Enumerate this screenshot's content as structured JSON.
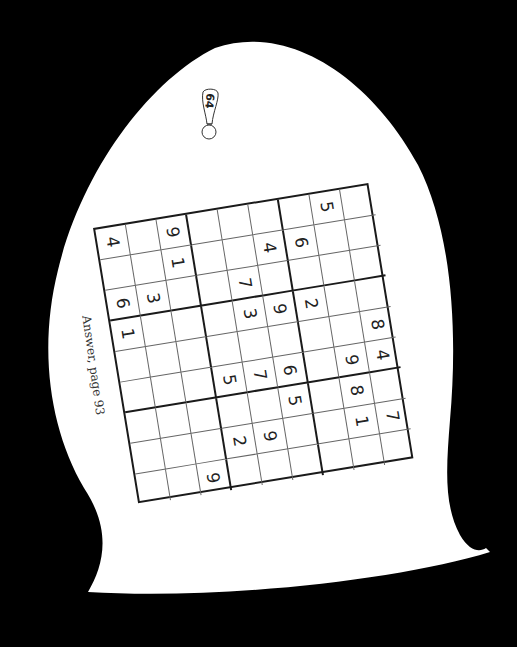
{
  "page": {
    "page_number": "64",
    "answer_reference": "Answer, page 93",
    "background_color": "#000000",
    "paper_color": "#ffffff"
  },
  "puzzle": {
    "type": "sudoku",
    "size": 9,
    "orientation_note": "grid printed rotated ~90deg clockwise; rows listed in screen order top-to-bottom, columns left-to-right",
    "grid": [
      [
        "4",
        "",
        "9",
        "",
        "",
        "",
        "",
        "5",
        ""
      ],
      [
        "",
        "",
        "1",
        "",
        "",
        "4",
        "6",
        "",
        ""
      ],
      [
        "6",
        "3",
        "",
        "",
        "7",
        "",
        "",
        "",
        ""
      ],
      [
        "1",
        "",
        "",
        "",
        "3",
        "9",
        "2",
        "",
        ""
      ],
      [
        "",
        "",
        "",
        "",
        "",
        "",
        "",
        "",
        "8"
      ],
      [
        "",
        "",
        "",
        "5",
        "7",
        "6",
        "",
        "9",
        "4"
      ],
      [
        "",
        "",
        "",
        "",
        "",
        "5",
        "",
        "8",
        ""
      ],
      [
        "",
        "",
        "",
        "2",
        "9",
        "",
        "",
        "1",
        "7"
      ],
      [
        "",
        "",
        "9",
        "",
        "",
        "",
        "",
        "",
        ""
      ]
    ]
  }
}
